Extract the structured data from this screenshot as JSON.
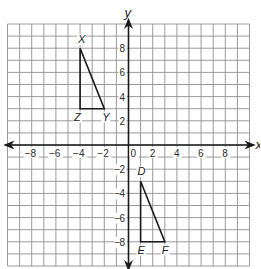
{
  "diagram": {
    "type": "coordinate-plane",
    "grid": {
      "x_min": -10,
      "x_max": 10,
      "y_min": -10,
      "y_max": 10,
      "step": 1
    },
    "axes": {
      "x_label": "x",
      "y_label": "y",
      "x_tick_labels": [
        {
          "value": -8,
          "text": "−8"
        },
        {
          "value": -6,
          "text": "−6"
        },
        {
          "value": -4,
          "text": "−4"
        },
        {
          "value": -2,
          "text": "−2"
        },
        {
          "value": 0,
          "text": "0"
        },
        {
          "value": 2,
          "text": "2"
        },
        {
          "value": 4,
          "text": "4"
        },
        {
          "value": 6,
          "text": "6"
        },
        {
          "value": 8,
          "text": "8"
        }
      ],
      "y_tick_labels": [
        {
          "value": 8,
          "text": "8"
        },
        {
          "value": 6,
          "text": "6"
        },
        {
          "value": 4,
          "text": "4"
        },
        {
          "value": 2,
          "text": "2"
        },
        {
          "value": -2,
          "text": "2"
        },
        {
          "value": -4,
          "text": "4"
        },
        {
          "value": -6,
          "text": "6"
        },
        {
          "value": -8,
          "text": "8"
        }
      ]
    },
    "triangles": [
      {
        "name": "XYZ",
        "vertices": [
          {
            "label": "X",
            "x": -4,
            "y": 8,
            "label_dx": -2,
            "label_dy": -5
          },
          {
            "label": "Y",
            "x": -2,
            "y": 3,
            "label_dx": -2,
            "label_dy": 12
          },
          {
            "label": "Z",
            "x": -4,
            "y": 3,
            "label_dx": -6,
            "label_dy": 12
          }
        ]
      },
      {
        "name": "DEF",
        "vertices": [
          {
            "label": "D",
            "x": 1,
            "y": -3,
            "label_dx": -3,
            "label_dy": -6
          },
          {
            "label": "E",
            "x": 1,
            "y": -8,
            "label_dx": -3,
            "label_dy": 12
          },
          {
            "label": "F",
            "x": 3,
            "y": -8,
            "label_dx": -3,
            "label_dy": 12
          }
        ]
      }
    ],
    "colors": {
      "grid": "#9a9a9a",
      "axis": "#1a1a1a",
      "triangle": "#1a1a1a",
      "background": "#ffffff"
    }
  }
}
